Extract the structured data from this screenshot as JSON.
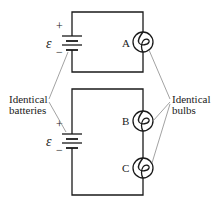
{
  "diagram": {
    "type": "circuit",
    "colors": {
      "wire": "#1a1a1a",
      "leader": "#8a8a8a",
      "background": "#ffffff"
    },
    "circuits": [
      {
        "id": "top",
        "battery": {
          "plus": "+",
          "minus": "−",
          "emf": "ε"
        },
        "bulbs": [
          {
            "label": "A"
          }
        ]
      },
      {
        "id": "bottom",
        "battery": {
          "plus": "+",
          "minus": "−",
          "emf": "ε"
        },
        "bulbs": [
          {
            "label": "B"
          },
          {
            "label": "C"
          }
        ]
      }
    ],
    "annotations": {
      "batteries": {
        "line1": "Identical",
        "line2": "batteries"
      },
      "bulbs": {
        "line1": "Identical",
        "line2": "bulbs"
      }
    }
  }
}
